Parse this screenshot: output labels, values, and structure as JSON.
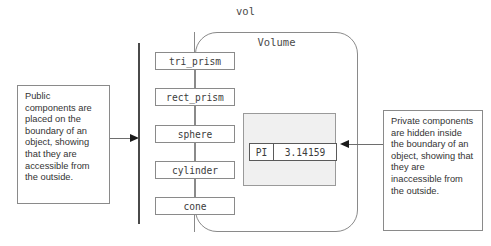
{
  "diagram": {
    "object_outer_label": "vol",
    "object_inner_label": "Volume",
    "public_components": [
      {
        "name": "tri_prism"
      },
      {
        "name": "rect_prism"
      },
      {
        "name": "sphere"
      },
      {
        "name": "cylinder"
      },
      {
        "name": "cone"
      }
    ],
    "private_members": [
      {
        "name": "PI",
        "value": "3.14159"
      }
    ],
    "annotations": {
      "left": "Public components are placed on the boundary of an object, showing that they are accessible from the outside.",
      "right": "Private components are hidden inside the boundary of an object, showing that they are inaccessible from the outside."
    },
    "colors": {
      "stroke": "#8a8a8a",
      "boundary_bar": "#4a4a4a",
      "private_fill": "#f0f0f0",
      "arrow": "#1a1a1a",
      "text": "#333333",
      "background": "#ffffff"
    }
  }
}
